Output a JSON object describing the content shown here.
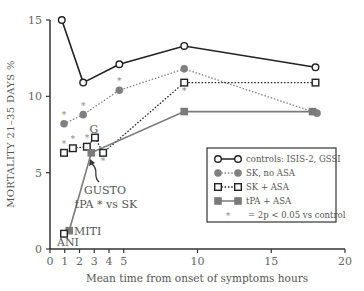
{
  "chart_data": {
    "type": "line",
    "title": "",
    "xlabel": "Mean time from onset of symptoms hours",
    "ylabel": "MORTALITY 21–35 DAYS %",
    "xlim": [
      0,
      20
    ],
    "ylim": [
      0,
      15
    ],
    "xticks": [
      0,
      1,
      2,
      3,
      4,
      5,
      10,
      15,
      20
    ],
    "yticks": [
      0,
      5,
      10,
      15
    ],
    "grid": false,
    "legend_position": "lower right",
    "series": [
      {
        "name": "controls: ISIS-2, GSSI",
        "style": "solid",
        "marker": "open-circle",
        "color": "#222222",
        "points": [
          [
            0.8,
            15.0
          ],
          [
            2.25,
            10.9
          ],
          [
            4.7,
            12.1
          ],
          [
            9.1,
            13.3
          ],
          [
            18.0,
            11.9
          ]
        ]
      },
      {
        "name": "SK, no ASA",
        "style": "dotted",
        "marker": "filled-circle",
        "color": "#808080",
        "points": [
          [
            0.95,
            8.2
          ],
          [
            2.25,
            8.8
          ],
          [
            4.7,
            10.4
          ],
          [
            9.1,
            11.8
          ],
          [
            18.1,
            8.9
          ]
        ],
        "significant": [
          true,
          true,
          true,
          false,
          false
        ]
      },
      {
        "name": "SK + ASA",
        "style": "dotted",
        "marker": "open-square",
        "color": "#222222",
        "points": [
          [
            0.95,
            6.3
          ],
          [
            1.55,
            6.6
          ],
          [
            2.5,
            6.7
          ],
          [
            3.05,
            7.3
          ],
          [
            3.6,
            6.3
          ],
          [
            9.1,
            10.9
          ],
          [
            18.0,
            10.9
          ]
        ],
        "significant": [
          true,
          true,
          true,
          false,
          true,
          true,
          false
        ]
      },
      {
        "name": "tPA + ASA",
        "style": "solid",
        "marker": "filled-square",
        "color": "#7a7a7a",
        "points": [
          [
            1.3,
            1.2
          ],
          [
            2.8,
            6.3
          ],
          [
            9.1,
            9.0
          ],
          [
            17.8,
            9.0
          ]
        ]
      }
    ],
    "extra_points": [
      {
        "name": "ANI",
        "marker": "open-square",
        "x": 0.95,
        "y": 1.0
      }
    ],
    "annotations": [
      {
        "text": "G",
        "x": 3.0,
        "y": 7.8
      },
      {
        "text": "GUSTO",
        "x": 3.9,
        "y": 3.5
      },
      {
        "text": "tPA * vs SK",
        "x": 3.9,
        "y": 2.5
      },
      {
        "text": "MITI",
        "x": 1.6,
        "y": 1.2
      },
      {
        "text": "ANI",
        "x": 0.5,
        "y": 0.3
      }
    ],
    "legend": [
      {
        "label": "controls: ISIS-2, GSSI"
      },
      {
        "label": "SK, no ASA"
      },
      {
        "label": "SK + ASA"
      },
      {
        "label": "tPA + ASA"
      },
      {
        "label": "= 2p < 0.05 vs control",
        "marker": "*"
      }
    ]
  }
}
